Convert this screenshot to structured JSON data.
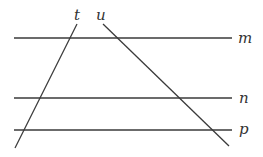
{
  "diagram": {
    "stroke_color": "#3a3a3a",
    "label_color": "#333333",
    "parallel_lines": [
      {
        "name": "m",
        "label": "m",
        "y": 38,
        "x1": 14,
        "x2": 232,
        "label_x": 238,
        "label_y": 43
      },
      {
        "name": "n",
        "label": "n",
        "y": 98,
        "x1": 14,
        "x2": 232,
        "label_x": 239,
        "label_y": 103
      },
      {
        "name": "p",
        "label": "p",
        "y": 130,
        "x1": 14,
        "x2": 232,
        "label_x": 239,
        "label_y": 134
      }
    ],
    "transversals": [
      {
        "name": "t",
        "label": "t",
        "x1": 77,
        "y1": 24,
        "x2": 15,
        "y2": 148,
        "label_x": 74,
        "label_y": 20
      },
      {
        "name": "u",
        "label": "u",
        "x1": 103,
        "y1": 24,
        "x2": 229,
        "y2": 146,
        "label_x": 96,
        "label_y": 20
      }
    ]
  }
}
